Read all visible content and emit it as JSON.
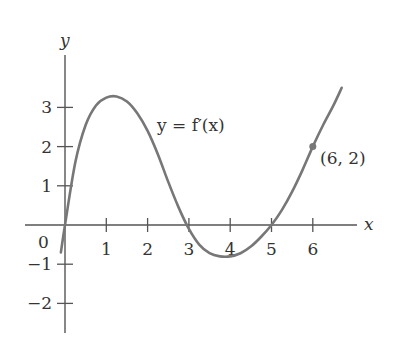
{
  "chart_data": {
    "type": "line",
    "title": "",
    "xlabel": "x",
    "ylabel": "y",
    "curve_label": "y = f′(x)",
    "origin_label": "0",
    "x_ticks": [
      1,
      2,
      3,
      4,
      5,
      6
    ],
    "x_tick_labels": [
      "1",
      "2",
      "3",
      "4",
      "5",
      "6"
    ],
    "y_ticks": [
      -2,
      -1,
      1,
      2,
      3
    ],
    "y_tick_labels": [
      "−2",
      "−1",
      "1",
      "2",
      "3"
    ],
    "xlim": [
      -1,
      7.4
    ],
    "ylim": [
      -2.6,
      4.3
    ],
    "grid": false,
    "series": [
      {
        "name": "f′(x)",
        "x": [
          -0.1,
          0,
          0.25,
          0.5,
          0.75,
          1.0,
          1.25,
          1.5,
          1.75,
          2.0,
          2.25,
          2.5,
          2.75,
          3.0,
          3.25,
          3.5,
          3.75,
          4.0,
          4.25,
          4.5,
          4.75,
          5.0,
          5.25,
          5.5,
          5.75,
          6.0,
          6.25,
          6.5,
          6.7
        ],
        "y": [
          -0.7,
          0,
          1.6,
          2.55,
          3.05,
          3.25,
          3.28,
          3.15,
          2.85,
          2.4,
          1.8,
          1.1,
          0.45,
          -0.1,
          -0.5,
          -0.72,
          -0.8,
          -0.8,
          -0.72,
          -0.55,
          -0.3,
          0,
          0.38,
          0.85,
          1.4,
          2.0,
          2.55,
          3.05,
          3.5
        ]
      }
    ],
    "annotations": [
      {
        "type": "point",
        "x": 6,
        "y": 2,
        "label": "(6, 2)"
      }
    ],
    "colors": {
      "curve": "#777777",
      "axes": "#555555",
      "text": "#333333"
    }
  }
}
